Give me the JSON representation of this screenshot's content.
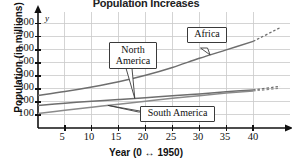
{
  "chart_data": {
    "type": "line",
    "title": "Population Increases",
    "xlabel": "Year (0 ↔ 1950)",
    "ylabel": "Population (in millions)",
    "x_axis_letter": "x",
    "y_axis_letter": "y",
    "xlim": [
      0,
      45
    ],
    "ylim": [
      0,
      860
    ],
    "grid": true,
    "legend": "callout-labels-on-curves",
    "xticks": [
      5,
      10,
      15,
      20,
      25,
      30,
      35,
      40
    ],
    "yticks": [
      100,
      200,
      300,
      400,
      500,
      600,
      700,
      800
    ],
    "series": [
      {
        "name": "Africa",
        "color": "#6e6e6e",
        "x": [
          0,
          5,
          10,
          15,
          20,
          25,
          30,
          35,
          40
        ],
        "values": [
          250,
          280,
          315,
          355,
          405,
          465,
          535,
          600,
          665
        ],
        "dashed_extension": {
          "x": [
            40,
            45
          ],
          "values": [
            665,
            770
          ]
        }
      },
      {
        "name": "North America",
        "color": "#6e6e6e",
        "x": [
          0,
          5,
          10,
          15,
          20,
          25,
          30,
          35,
          40
        ],
        "values": [
          172,
          190,
          205,
          218,
          232,
          248,
          262,
          278,
          292
        ],
        "dashed_extension": {
          "x": [
            40,
            45
          ],
          "values": [
            292,
            320
          ]
        }
      },
      {
        "name": "South America",
        "color": "#8a8a8a",
        "x": [
          0,
          5,
          10,
          15,
          20,
          25,
          30,
          35,
          40
        ],
        "values": [
          112,
          136,
          160,
          182,
          205,
          228,
          248,
          268,
          285
        ],
        "dashed_extension": {
          "x": [
            40,
            45
          ],
          "values": [
            285,
            305
          ]
        }
      }
    ],
    "annotations": [
      {
        "label": "North America",
        "lines": [
          "North",
          "America"
        ],
        "points_to_series": "North America",
        "points_to_x": 18
      },
      {
        "label": "Africa",
        "lines": [
          "Africa"
        ],
        "points_to_series": "Africa",
        "points_to_x": 32
      },
      {
        "label": "South America",
        "lines": [
          "South America"
        ],
        "points_to_series": "South America",
        "points_to_x": 13
      }
    ]
  },
  "colors": {
    "grid": "#c9c9c9",
    "axis": "#111111",
    "curve_dark": "#6e6e6e",
    "curve_light": "#8a8a8a",
    "callout_border": "#3a3a3a",
    "background": "#ffffff"
  },
  "yticks_text": [
    "800",
    "700",
    "600",
    "500",
    "400",
    "300",
    "200",
    "100"
  ],
  "xticks_text": [
    "5",
    "10",
    "15",
    "20",
    "25",
    "30",
    "35",
    "40"
  ]
}
